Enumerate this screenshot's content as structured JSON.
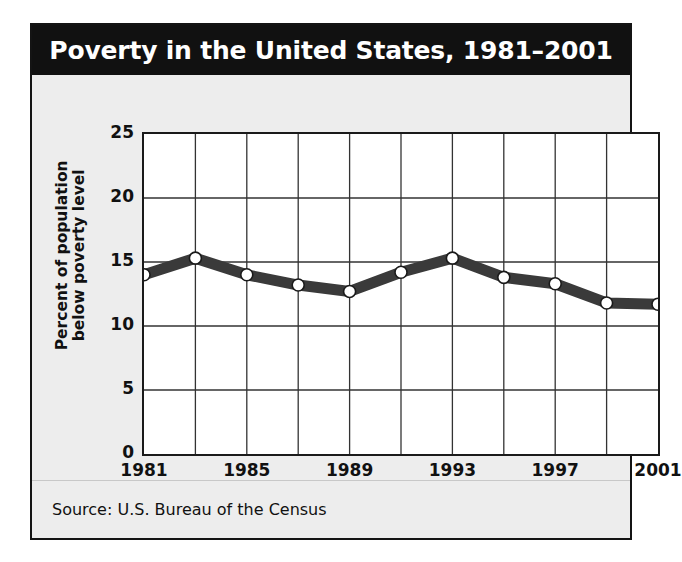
{
  "figure": {
    "title": "Poverty in the United States, 1981–2001",
    "source": "Source: U.S. Bureau of the Census",
    "ylabel_line1": "Percent of population",
    "ylabel_line2": "below poverty level",
    "colors": {
      "title_bar_bg": "#111111",
      "title_text": "#ffffff",
      "panel_bg": "#ededed",
      "plot_bg": "#ffffff",
      "grid": "#333333",
      "axis": "#1a1a1a",
      "line": "#3a3a3a",
      "marker_fill": "#ffffff",
      "marker_stroke": "#1a1a1a"
    }
  },
  "chart_data": {
    "type": "line",
    "title": "Poverty in the United States, 1981–2001",
    "xlabel": "",
    "ylabel": "Percent of population below poverty level",
    "x": [
      1981,
      1983,
      1985,
      1987,
      1989,
      1991,
      1993,
      1995,
      1997,
      1999,
      2001
    ],
    "values": [
      14.0,
      15.3,
      14.0,
      13.2,
      12.7,
      14.2,
      15.3,
      13.8,
      13.3,
      11.8,
      11.7
    ],
    "series": [
      {
        "name": "Percent of population below poverty level",
        "values": [
          14.0,
          15.3,
          14.0,
          13.2,
          12.7,
          14.2,
          15.3,
          13.8,
          13.3,
          11.8,
          11.7
        ]
      }
    ],
    "xlim": [
      1981,
      2001
    ],
    "ylim": [
      0,
      25
    ],
    "yticks": [
      0,
      5,
      10,
      15,
      20,
      25
    ],
    "xticks": [
      1981,
      1985,
      1989,
      1993,
      1997,
      2001
    ],
    "xgridlines": [
      1981,
      1983,
      1985,
      1987,
      1989,
      1991,
      1993,
      1995,
      1997,
      1999,
      2001
    ],
    "ygridlines": [
      5,
      10,
      15,
      20
    ],
    "grid": true,
    "legend": false,
    "source": "Source: U.S. Bureau of the Census"
  }
}
